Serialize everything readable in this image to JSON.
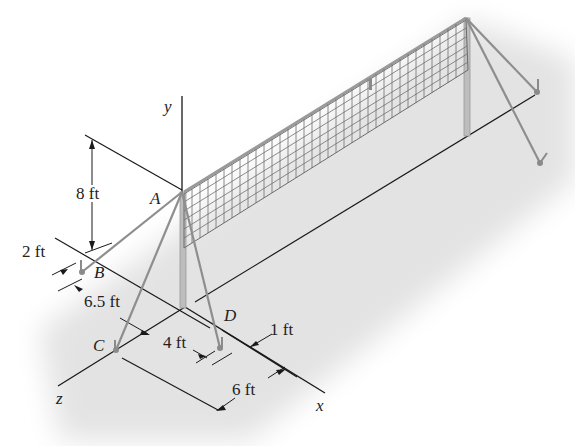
{
  "figure": {
    "axes": {
      "x": "x",
      "y": "y",
      "z": "z"
    },
    "points": {
      "A": "A",
      "B": "B",
      "C": "C",
      "D": "D"
    },
    "dimensions": {
      "height_A": "8 ft",
      "offset_B": "2 ft",
      "dist_B_origin": "6.5 ft",
      "dist_C_D": "4 ft",
      "offset_D": "1 ft",
      "dist_x": "6 ft"
    },
    "colors": {
      "background_shade": "#e6e6e6",
      "lines": "#1a1a1a",
      "wire": "#8a8a8a",
      "post": "#b5b5b5",
      "net": "#6b6b6b"
    }
  }
}
